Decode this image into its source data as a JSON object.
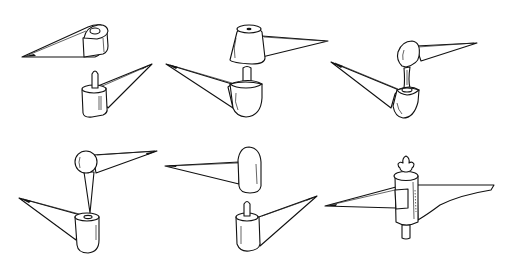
{
  "figure": {
    "background": "#ffffff",
    "line_color": "#111111",
    "panels": [
      {
        "id": 1,
        "position": "top-left",
        "type": "flat-arm with hole over pin-knuckle arm",
        "parts": [
          "upper tapered arm with hole",
          "lower arm with knuckle and pin"
        ]
      },
      {
        "id": 2,
        "position": "top-center",
        "type": "domed cap over short-pin knuckle",
        "parts": [
          "upper domed cap arm",
          "lower rounded knuckle arm with pin"
        ]
      },
      {
        "id": 3,
        "position": "top-right",
        "type": "ball-on-stem over socket knuckle",
        "parts": [
          "upper ball arm with stem",
          "lower socket knuckle arm"
        ]
      },
      {
        "id": 4,
        "position": "bottom-left",
        "type": "ball with tapered stem into socket",
        "parts": [
          "upper ball arm with conical stem",
          "lower knuckle arm with socket"
        ]
      },
      {
        "id": 5,
        "position": "bottom-center",
        "type": "capsule cap over pin knuckle",
        "parts": [
          "upper capsule cap arm",
          "lower cylindrical knuckle arm with pin"
        ]
      },
      {
        "id": 6,
        "position": "bottom-right",
        "type": "assembled hinge with fleur-de-lis finial",
        "parts": [
          "fleur-de-lis finial",
          "cylindrical barrel",
          "left tapered arm with strap",
          "right curved arm",
          "bottom pin"
        ]
      }
    ]
  }
}
